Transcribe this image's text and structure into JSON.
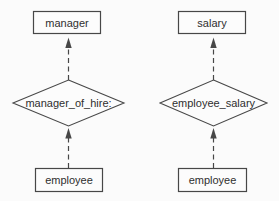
{
  "diagram": {
    "type": "entity-relationship",
    "entities": [
      {
        "id": "manager",
        "label": "manager"
      },
      {
        "id": "salary",
        "label": "salary"
      },
      {
        "id": "employee-left",
        "label": "employee"
      },
      {
        "id": "employee-right",
        "label": "employee"
      }
    ],
    "relationships": [
      {
        "id": "manager-of-hire",
        "label": "manager_of_hire:"
      },
      {
        "id": "employee-salary",
        "label": "employee_salary"
      }
    ],
    "edges": [
      {
        "from": "manager_of_hire:",
        "to": "manager",
        "style": "dashed-arrow-up"
      },
      {
        "from": "employee (left)",
        "to": "manager_of_hire:",
        "style": "dashed-arrow-up"
      },
      {
        "from": "employee_salary",
        "to": "salary",
        "style": "dashed-arrow-up"
      },
      {
        "from": "employee (right)",
        "to": "employee_salary",
        "style": "dashed-arrow-up"
      }
    ],
    "colors": {
      "line": "#474747",
      "text": "#2f2f2f",
      "background": "#fbfbfb",
      "box_fill": "#fcfcfc"
    }
  }
}
